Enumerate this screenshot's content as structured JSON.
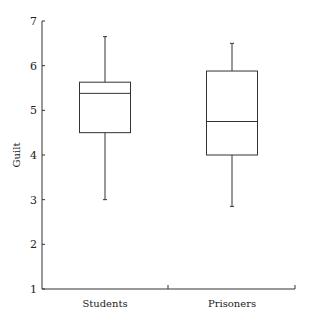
{
  "chart_data": {
    "type": "box",
    "title": "",
    "xlabel": "",
    "ylabel": "Guilt",
    "ylim": [
      1,
      7
    ],
    "yticks": [
      1,
      2,
      3,
      4,
      5,
      6,
      7
    ],
    "categories": [
      "Students",
      "Prisoners"
    ],
    "series": [
      {
        "name": "Students",
        "whisker_low": 3.0,
        "q1": 4.5,
        "median": 5.38,
        "q3": 5.63,
        "whisker_high": 6.65
      },
      {
        "name": "Prisoners",
        "whisker_low": 2.85,
        "q1": 4.0,
        "median": 4.75,
        "q3": 5.88,
        "whisker_high": 6.5
      }
    ],
    "grid": false,
    "legend": "none"
  },
  "layout": {
    "plot_left": 42,
    "plot_right": 295,
    "plot_top": 21,
    "plot_bottom": 289,
    "category_centers": [
      105,
      232
    ],
    "box_width": 51,
    "category_dividers": [
      168,
      295
    ],
    "line_color": "#333333"
  }
}
